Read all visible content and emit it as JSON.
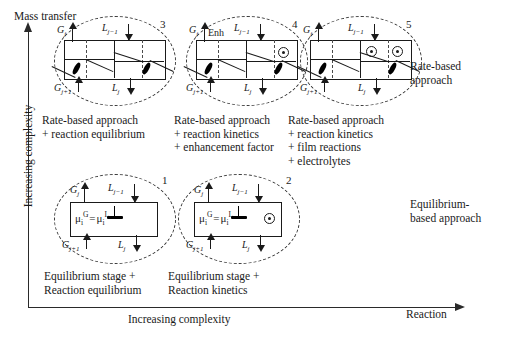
{
  "figure": {
    "top_label": "Mass transfer",
    "y_axis_label": "Increasing complexity",
    "x_axis_label": "Increasing complexity",
    "x_axis_end_label": "Reaction",
    "side_labels": {
      "rate_based": [
        "Rate-based",
        "approach"
      ],
      "equilibrium_based": [
        "Equilibrium-",
        "based approach"
      ]
    }
  },
  "stream_labels": {
    "gas_out": "G",
    "gas_out_sub": "j",
    "liquid_in": "L",
    "liquid_in_sub": "j−1",
    "gas_in": "G",
    "gas_in_sub": "j+1",
    "liquid_out": "L",
    "liquid_out_sub": "j"
  },
  "equation": {
    "lhs": "μ",
    "lhs_sub": "i",
    "lhs_sup": "G",
    "eq": "=",
    "rhs": "μ",
    "rhs_sub": "i",
    "rhs_sup": "L"
  },
  "cells": [
    {
      "id": "cell-1",
      "number": "1",
      "type": "equilibrium",
      "has_equation": true,
      "has_anvil": true,
      "has_kinetics_circle": false,
      "caption": [
        "Equilibrium stage +",
        "Reaction equilibrium"
      ]
    },
    {
      "id": "cell-2",
      "number": "2",
      "type": "equilibrium",
      "has_equation": true,
      "has_anvil": true,
      "has_kinetics_circle": true,
      "caption": [
        "Equilibrium stage +",
        "Reaction kinetics"
      ]
    },
    {
      "id": "cell-3",
      "number": "3",
      "type": "rate-based",
      "enh_label": "",
      "circles": 0,
      "caption": [
        "Rate-based approach",
        "+ reaction equilibrium"
      ]
    },
    {
      "id": "cell-4",
      "number": "4",
      "type": "rate-based",
      "enh_label": "Enh",
      "circles": 1,
      "caption": [
        "Rate-based approach",
        "+ reaction kinetics",
        "+ enhancement factor"
      ]
    },
    {
      "id": "cell-5",
      "number": "5",
      "type": "rate-based",
      "enh_label": "",
      "circles": 2,
      "caption": [
        "Rate-based approach",
        "+ reaction kinetics",
        "+ film reactions",
        "+ electrolytes"
      ]
    }
  ],
  "colors": {
    "ink": "#1a1a1a",
    "background": "#ffffff",
    "dashed": "#3a3a3a"
  }
}
